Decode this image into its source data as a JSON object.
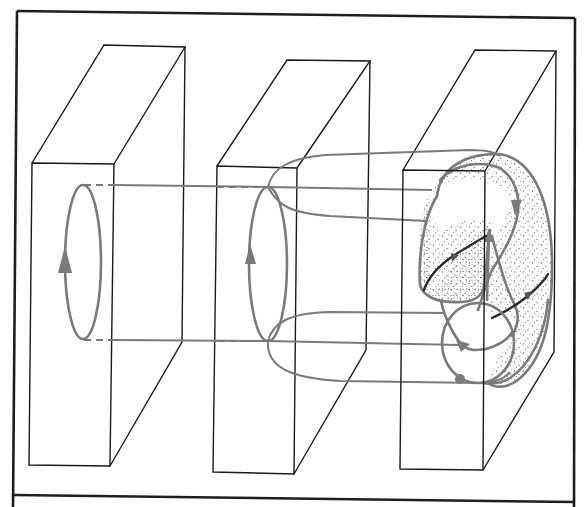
{
  "colors": {
    "frame": "#1e1e1e",
    "slab_edges": "#1a1a1a",
    "orbit": "#7a7a7a",
    "trajectory_dark": "#2a2a2a",
    "stipple": "#6b6b6b",
    "background": "#ffffff"
  },
  "elements": {
    "slabs": [
      {
        "name": "left-slab",
        "label": ""
      },
      {
        "name": "middle-slab",
        "label": ""
      },
      {
        "name": "right-slab",
        "label": ""
      }
    ],
    "arrows": [
      {
        "name": "left-loop-arrow",
        "direction": "up"
      },
      {
        "name": "middle-loop-arrow",
        "direction": "up"
      },
      {
        "name": "right-surface-arrow-top",
        "direction": "down"
      },
      {
        "name": "right-surface-arrow-center",
        "direction": "up"
      },
      {
        "name": "right-circle-arrow",
        "direction": "down-right"
      }
    ],
    "icons": [
      "arrowhead-icon",
      "dot-icon"
    ]
  }
}
